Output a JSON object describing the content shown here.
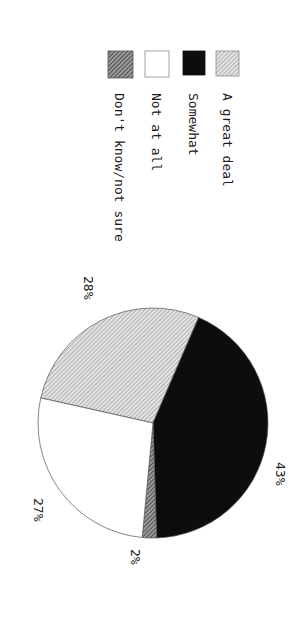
{
  "chart_data": {
    "type": "pie",
    "title": "",
    "orientation": "rotated 90 degrees clockwise",
    "legend_position": "top (left side of chart in reading orientation)",
    "slices": [
      {
        "label": "A great deal",
        "value": 28,
        "display": "28%",
        "fill": "hatch-light",
        "color": "#bdbdbd"
      },
      {
        "label": "Somewhat",
        "value": 43,
        "display": "43%",
        "fill": "solid",
        "color": "#0d0d0d"
      },
      {
        "label": "Don't know/not sure",
        "value": 2,
        "display": "2%",
        "fill": "hatch-dark",
        "color": "#6b6b6b"
      },
      {
        "label": "Not at all",
        "value": 27,
        "display": "27%",
        "fill": "solid",
        "color": "#ffffff"
      }
    ],
    "categories": [
      "A great deal",
      "Somewhat",
      "Don't know/not sure",
      "Not at all"
    ],
    "values": [
      28,
      43,
      2,
      27
    ],
    "unit": "%"
  },
  "legend": {
    "items": [
      {
        "label": "A great deal",
        "swatch": "hatch-light"
      },
      {
        "label": "Somewhat",
        "swatch": "solid-black"
      },
      {
        "label": "Not at all",
        "swatch": "white"
      },
      {
        "label": "Don't know/not sure",
        "swatch": "hatch-dark"
      }
    ]
  },
  "labels": {
    "great_deal": "28%",
    "somewhat": "43%",
    "dont_know": "2%",
    "not_at_all": "27%"
  }
}
